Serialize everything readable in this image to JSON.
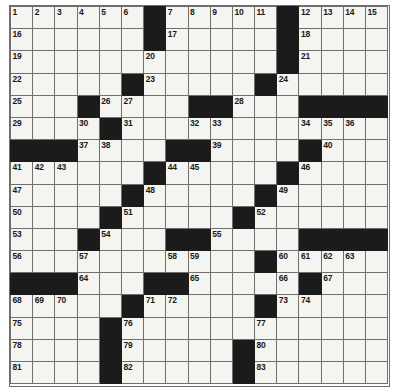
{
  "puzzle": {
    "name": "crossword-grid",
    "rows": 17,
    "columns": 17,
    "cell_size_px": 22.2,
    "colors": {
      "block": "#1b1b1b",
      "cell": "#f4f4f0",
      "grid_line": "#6f6f6f",
      "number_text": "#1a1a1a",
      "background": "#ffffff"
    },
    "highest_clue_number": 83,
    "grid": [
      [
        {
          "t": "w",
          "n": "1"
        },
        {
          "t": "w",
          "n": "2"
        },
        {
          "t": "w",
          "n": "3"
        },
        {
          "t": "w",
          "n": "4"
        },
        {
          "t": "w",
          "n": "5"
        },
        {
          "t": "w",
          "n": "6"
        },
        {
          "t": "b",
          "n": ""
        },
        {
          "t": "w",
          "n": "7"
        },
        {
          "t": "w",
          "n": "8"
        },
        {
          "t": "w",
          "n": "9"
        },
        {
          "t": "w",
          "n": "10"
        },
        {
          "t": "w",
          "n": "11"
        },
        {
          "t": "b",
          "n": ""
        },
        {
          "t": "w",
          "n": "12"
        },
        {
          "t": "w",
          "n": "13"
        },
        {
          "t": "w",
          "n": "14"
        },
        {
          "t": "w",
          "n": "15"
        }
      ],
      [
        {
          "t": "w",
          "n": "16"
        },
        {
          "t": "w",
          "n": ""
        },
        {
          "t": "w",
          "n": ""
        },
        {
          "t": "w",
          "n": ""
        },
        {
          "t": "w",
          "n": ""
        },
        {
          "t": "w",
          "n": ""
        },
        {
          "t": "b",
          "n": ""
        },
        {
          "t": "w",
          "n": "17"
        },
        {
          "t": "w",
          "n": ""
        },
        {
          "t": "w",
          "n": ""
        },
        {
          "t": "w",
          "n": ""
        },
        {
          "t": "w",
          "n": ""
        },
        {
          "t": "b",
          "n": ""
        },
        {
          "t": "w",
          "n": "18"
        },
        {
          "t": "w",
          "n": ""
        },
        {
          "t": "w",
          "n": ""
        },
        {
          "t": "w",
          "n": ""
        }
      ],
      [
        {
          "t": "w",
          "n": "19"
        },
        {
          "t": "w",
          "n": ""
        },
        {
          "t": "w",
          "n": ""
        },
        {
          "t": "w",
          "n": ""
        },
        {
          "t": "w",
          "n": ""
        },
        {
          "t": "w",
          "n": ""
        },
        {
          "t": "w",
          "n": "20"
        },
        {
          "t": "w",
          "n": ""
        },
        {
          "t": "w",
          "n": ""
        },
        {
          "t": "w",
          "n": ""
        },
        {
          "t": "w",
          "n": ""
        },
        {
          "t": "w",
          "n": ""
        },
        {
          "t": "b",
          "n": ""
        },
        {
          "t": "w",
          "n": "21"
        },
        {
          "t": "w",
          "n": ""
        },
        {
          "t": "w",
          "n": ""
        },
        {
          "t": "w",
          "n": ""
        }
      ],
      [
        {
          "t": "w",
          "n": "22"
        },
        {
          "t": "w",
          "n": ""
        },
        {
          "t": "w",
          "n": ""
        },
        {
          "t": "w",
          "n": ""
        },
        {
          "t": "w",
          "n": ""
        },
        {
          "t": "b",
          "n": ""
        },
        {
          "t": "w",
          "n": "23"
        },
        {
          "t": "w",
          "n": ""
        },
        {
          "t": "w",
          "n": ""
        },
        {
          "t": "w",
          "n": ""
        },
        {
          "t": "w",
          "n": ""
        },
        {
          "t": "b",
          "n": ""
        },
        {
          "t": "w",
          "n": "24"
        },
        {
          "t": "w",
          "n": ""
        },
        {
          "t": "w",
          "n": ""
        },
        {
          "t": "w",
          "n": ""
        },
        {
          "t": "w",
          "n": ""
        }
      ],
      [
        {
          "t": "w",
          "n": "25"
        },
        {
          "t": "w",
          "n": ""
        },
        {
          "t": "w",
          "n": ""
        },
        {
          "t": "b",
          "n": ""
        },
        {
          "t": "w",
          "n": "26"
        },
        {
          "t": "w",
          "n": "27"
        },
        {
          "t": "w",
          "n": ""
        },
        {
          "t": "w",
          "n": ""
        },
        {
          "t": "b",
          "n": ""
        },
        {
          "t": "b",
          "n": ""
        },
        {
          "t": "w",
          "n": "28"
        },
        {
          "t": "w",
          "n": ""
        },
        {
          "t": "w",
          "n": ""
        },
        {
          "t": "b",
          "n": ""
        },
        {
          "t": "b",
          "n": ""
        },
        {
          "t": "b",
          "n": ""
        },
        {
          "t": "b",
          "n": ""
        }
      ],
      [
        {
          "t": "w",
          "n": "29"
        },
        {
          "t": "w",
          "n": ""
        },
        {
          "t": "w",
          "n": ""
        },
        {
          "t": "w",
          "n": "30"
        },
        {
          "t": "b",
          "n": ""
        },
        {
          "t": "w",
          "n": "31"
        },
        {
          "t": "w",
          "n": ""
        },
        {
          "t": "w",
          "n": ""
        },
        {
          "t": "w",
          "n": "32"
        },
        {
          "t": "w",
          "n": "33"
        },
        {
          "t": "w",
          "n": ""
        },
        {
          "t": "w",
          "n": ""
        },
        {
          "t": "w",
          "n": ""
        },
        {
          "t": "w",
          "n": "34"
        },
        {
          "t": "w",
          "n": "35"
        },
        {
          "t": "w",
          "n": "36"
        },
        {
          "t": "w",
          "n": ""
        }
      ],
      [
        {
          "t": "b",
          "n": ""
        },
        {
          "t": "b",
          "n": ""
        },
        {
          "t": "b",
          "n": ""
        },
        {
          "t": "w",
          "n": "37"
        },
        {
          "t": "w",
          "n": "38"
        },
        {
          "t": "w",
          "n": ""
        },
        {
          "t": "w",
          "n": ""
        },
        {
          "t": "b",
          "n": ""
        },
        {
          "t": "b",
          "n": ""
        },
        {
          "t": "w",
          "n": "39"
        },
        {
          "t": "w",
          "n": ""
        },
        {
          "t": "w",
          "n": ""
        },
        {
          "t": "w",
          "n": ""
        },
        {
          "t": "b",
          "n": ""
        },
        {
          "t": "w",
          "n": "40"
        },
        {
          "t": "w",
          "n": ""
        },
        {
          "t": "w",
          "n": ""
        }
      ],
      [
        {
          "t": "w",
          "n": "41"
        },
        {
          "t": "w",
          "n": "42"
        },
        {
          "t": "w",
          "n": "43"
        },
        {
          "t": "w",
          "n": ""
        },
        {
          "t": "w",
          "n": ""
        },
        {
          "t": "w",
          "n": ""
        },
        {
          "t": "b",
          "n": ""
        },
        {
          "t": "w",
          "n": "44"
        },
        {
          "t": "w",
          "n": "45"
        },
        {
          "t": "w",
          "n": ""
        },
        {
          "t": "w",
          "n": ""
        },
        {
          "t": "w",
          "n": ""
        },
        {
          "t": "b",
          "n": ""
        },
        {
          "t": "w",
          "n": "46"
        },
        {
          "t": "w",
          "n": ""
        },
        {
          "t": "w",
          "n": ""
        },
        {
          "t": "w",
          "n": ""
        }
      ],
      [
        {
          "t": "w",
          "n": "47"
        },
        {
          "t": "w",
          "n": ""
        },
        {
          "t": "w",
          "n": ""
        },
        {
          "t": "w",
          "n": ""
        },
        {
          "t": "w",
          "n": ""
        },
        {
          "t": "b",
          "n": ""
        },
        {
          "t": "w",
          "n": "48"
        },
        {
          "t": "w",
          "n": ""
        },
        {
          "t": "w",
          "n": ""
        },
        {
          "t": "w",
          "n": ""
        },
        {
          "t": "w",
          "n": ""
        },
        {
          "t": "b",
          "n": ""
        },
        {
          "t": "w",
          "n": "49"
        },
        {
          "t": "w",
          "n": ""
        },
        {
          "t": "w",
          "n": ""
        },
        {
          "t": "w",
          "n": ""
        },
        {
          "t": "w",
          "n": ""
        }
      ],
      [
        {
          "t": "w",
          "n": "50"
        },
        {
          "t": "w",
          "n": ""
        },
        {
          "t": "w",
          "n": ""
        },
        {
          "t": "w",
          "n": ""
        },
        {
          "t": "b",
          "n": ""
        },
        {
          "t": "w",
          "n": "51"
        },
        {
          "t": "w",
          "n": ""
        },
        {
          "t": "w",
          "n": ""
        },
        {
          "t": "w",
          "n": ""
        },
        {
          "t": "w",
          "n": ""
        },
        {
          "t": "b",
          "n": ""
        },
        {
          "t": "w",
          "n": "52"
        },
        {
          "t": "w",
          "n": ""
        },
        {
          "t": "w",
          "n": ""
        },
        {
          "t": "w",
          "n": ""
        },
        {
          "t": "w",
          "n": ""
        },
        {
          "t": "w",
          "n": ""
        }
      ],
      [
        {
          "t": "w",
          "n": "53"
        },
        {
          "t": "w",
          "n": ""
        },
        {
          "t": "w",
          "n": ""
        },
        {
          "t": "b",
          "n": ""
        },
        {
          "t": "w",
          "n": "54"
        },
        {
          "t": "w",
          "n": ""
        },
        {
          "t": "w",
          "n": ""
        },
        {
          "t": "b",
          "n": ""
        },
        {
          "t": "b",
          "n": ""
        },
        {
          "t": "w",
          "n": "55"
        },
        {
          "t": "w",
          "n": ""
        },
        {
          "t": "w",
          "n": ""
        },
        {
          "t": "w",
          "n": ""
        },
        {
          "t": "b",
          "n": ""
        },
        {
          "t": "b",
          "n": ""
        },
        {
          "t": "b",
          "n": ""
        },
        {
          "t": "b",
          "n": ""
        }
      ],
      [
        {
          "t": "w",
          "n": "56"
        },
        {
          "t": "w",
          "n": ""
        },
        {
          "t": "w",
          "n": ""
        },
        {
          "t": "w",
          "n": "57"
        },
        {
          "t": "w",
          "n": ""
        },
        {
          "t": "w",
          "n": ""
        },
        {
          "t": "w",
          "n": ""
        },
        {
          "t": "w",
          "n": "58"
        },
        {
          "t": "w",
          "n": "59"
        },
        {
          "t": "w",
          "n": ""
        },
        {
          "t": "w",
          "n": ""
        },
        {
          "t": "b",
          "n": ""
        },
        {
          "t": "w",
          "n": "60"
        },
        {
          "t": "w",
          "n": "61"
        },
        {
          "t": "w",
          "n": "62"
        },
        {
          "t": "w",
          "n": "63"
        },
        {
          "t": "w",
          "n": ""
        }
      ],
      [
        {
          "t": "b",
          "n": ""
        },
        {
          "t": "b",
          "n": ""
        },
        {
          "t": "b",
          "n": ""
        },
        {
          "t": "w",
          "n": "64"
        },
        {
          "t": "w",
          "n": ""
        },
        {
          "t": "w",
          "n": ""
        },
        {
          "t": "b",
          "n": ""
        },
        {
          "t": "b",
          "n": ""
        },
        {
          "t": "w",
          "n": "65"
        },
        {
          "t": "w",
          "n": ""
        },
        {
          "t": "w",
          "n": ""
        },
        {
          "t": "w",
          "n": ""
        },
        {
          "t": "w",
          "n": "66"
        },
        {
          "t": "b",
          "n": ""
        },
        {
          "t": "w",
          "n": "67"
        },
        {
          "t": "w",
          "n": ""
        },
        {
          "t": "w",
          "n": ""
        }
      ],
      [
        {
          "t": "w",
          "n": "68"
        },
        {
          "t": "w",
          "n": "69"
        },
        {
          "t": "w",
          "n": "70"
        },
        {
          "t": "w",
          "n": ""
        },
        {
          "t": "w",
          "n": ""
        },
        {
          "t": "b",
          "n": ""
        },
        {
          "t": "w",
          "n": "71"
        },
        {
          "t": "w",
          "n": "72"
        },
        {
          "t": "w",
          "n": ""
        },
        {
          "t": "w",
          "n": ""
        },
        {
          "t": "w",
          "n": ""
        },
        {
          "t": "b",
          "n": ""
        },
        {
          "t": "w",
          "n": "73"
        },
        {
          "t": "w",
          "n": "74"
        },
        {
          "t": "w",
          "n": ""
        },
        {
          "t": "w",
          "n": ""
        },
        {
          "t": "w",
          "n": ""
        }
      ],
      [
        {
          "t": "w",
          "n": "75"
        },
        {
          "t": "w",
          "n": ""
        },
        {
          "t": "w",
          "n": ""
        },
        {
          "t": "w",
          "n": ""
        },
        {
          "t": "b",
          "n": ""
        },
        {
          "t": "w",
          "n": "76"
        },
        {
          "t": "w",
          "n": ""
        },
        {
          "t": "w",
          "n": ""
        },
        {
          "t": "w",
          "n": ""
        },
        {
          "t": "w",
          "n": ""
        },
        {
          "t": "w",
          "n": ""
        },
        {
          "t": "w",
          "n": "77"
        },
        {
          "t": "w",
          "n": ""
        },
        {
          "t": "w",
          "n": ""
        },
        {
          "t": "w",
          "n": ""
        },
        {
          "t": "w",
          "n": ""
        },
        {
          "t": "w",
          "n": ""
        }
      ],
      [
        {
          "t": "w",
          "n": "78"
        },
        {
          "t": "w",
          "n": ""
        },
        {
          "t": "w",
          "n": ""
        },
        {
          "t": "w",
          "n": ""
        },
        {
          "t": "b",
          "n": ""
        },
        {
          "t": "w",
          "n": "79"
        },
        {
          "t": "w",
          "n": ""
        },
        {
          "t": "w",
          "n": ""
        },
        {
          "t": "w",
          "n": ""
        },
        {
          "t": "w",
          "n": ""
        },
        {
          "t": "b",
          "n": ""
        },
        {
          "t": "w",
          "n": "80"
        },
        {
          "t": "w",
          "n": ""
        },
        {
          "t": "w",
          "n": ""
        },
        {
          "t": "w",
          "n": ""
        },
        {
          "t": "w",
          "n": ""
        },
        {
          "t": "w",
          "n": ""
        }
      ],
      [
        {
          "t": "w",
          "n": "81"
        },
        {
          "t": "w",
          "n": ""
        },
        {
          "t": "w",
          "n": ""
        },
        {
          "t": "w",
          "n": ""
        },
        {
          "t": "b",
          "n": ""
        },
        {
          "t": "w",
          "n": "82"
        },
        {
          "t": "w",
          "n": ""
        },
        {
          "t": "w",
          "n": ""
        },
        {
          "t": "w",
          "n": ""
        },
        {
          "t": "w",
          "n": ""
        },
        {
          "t": "b",
          "n": ""
        },
        {
          "t": "w",
          "n": "83"
        },
        {
          "t": "w",
          "n": ""
        },
        {
          "t": "w",
          "n": ""
        },
        {
          "t": "w",
          "n": ""
        },
        {
          "t": "w",
          "n": ""
        },
        {
          "t": "w",
          "n": ""
        }
      ]
    ]
  }
}
